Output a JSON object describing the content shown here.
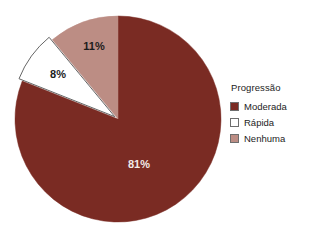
{
  "chart_data": {
    "type": "pie",
    "title": "",
    "legend_title": "Progressão",
    "legend_position": "right",
    "categories": [
      "Moderada",
      "Rápida",
      "Nenhuma"
    ],
    "values": [
      81,
      8,
      11
    ],
    "value_labels": [
      "81%",
      "8%",
      "11%"
    ],
    "colors": [
      "#7a2b23",
      "#ffffff",
      "#bc8d84"
    ],
    "units": "percent",
    "start_angle_deg": 0,
    "direction": "clockwise",
    "exploded_slices": [
      "Rápida"
    ],
    "slices": [
      {
        "name": "Moderada",
        "value": 81,
        "label": "81%",
        "color": "#7a2b23",
        "label_color": "#f2eae8",
        "label_x": 139,
        "label_y": 168,
        "exploded": false
      },
      {
        "name": "Nenhuma",
        "value": 11,
        "label": "11%",
        "color": "#bc8d84",
        "label_color": "#1c1c1c",
        "label_x": 94,
        "label_y": 50,
        "exploded": false
      },
      {
        "name": "Rápida",
        "value": 8,
        "label": "8%",
        "color": "#ffffff",
        "label_color": "#1c1c1c",
        "label_x": 58,
        "label_y": 78,
        "exploded": true
      }
    ],
    "geometry": {
      "center_x": 118,
      "center_y": 119,
      "radius": 103,
      "explode_offset": 4
    }
  },
  "legend": {
    "title": "Progressão",
    "items": [
      {
        "label": "Moderada",
        "color": "#7a2b23"
      },
      {
        "label": "Rápida",
        "color": "#ffffff"
      },
      {
        "label": "Nenhuma",
        "color": "#bc8d84"
      }
    ]
  }
}
